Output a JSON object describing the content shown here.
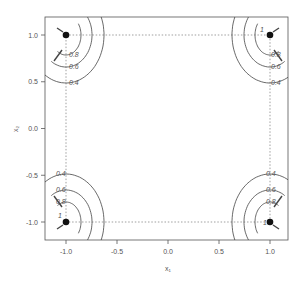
{
  "chart_data": {
    "type": "contour",
    "title": "",
    "xlabel": "x₁",
    "ylabel": "x₂",
    "xlim": [
      -1.15,
      1.15
    ],
    "ylim": [
      -1.2,
      1.2
    ],
    "x_ticks": [
      -1.0,
      -0.5,
      0.0,
      0.5,
      1.0
    ],
    "x_tick_labels": [
      "-1.0",
      "-0.5",
      "0.0",
      "0.5",
      "1.0"
    ],
    "y_ticks": [
      -1.0,
      -0.5,
      0.0,
      0.5,
      1.0
    ],
    "y_tick_labels": [
      "-1.0",
      "-0.5",
      "0.0",
      "0.5",
      "1.0"
    ],
    "grid": false,
    "contour_levels": [
      0.4,
      0.6,
      0.8,
      1
    ],
    "contour_level_labels": [
      "0.4",
      "0.6",
      "0.8",
      "1"
    ],
    "points": [
      {
        "x": -1,
        "y": 1
      },
      {
        "x": 1,
        "y": 1
      },
      {
        "x": -1,
        "y": -1
      },
      {
        "x": 1,
        "y": -1
      }
    ],
    "reference_square": {
      "x": [
        -1,
        1
      ],
      "y": [
        -1,
        1
      ],
      "style": "dotted"
    }
  },
  "colors": {
    "frame": "#555555",
    "contour": "#444444",
    "point": "#111111",
    "dotted": "#777777"
  }
}
